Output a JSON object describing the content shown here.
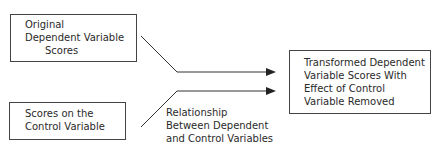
{
  "boxes": {
    "original": {
      "lines": [
        "Original",
        "Dependent Variable",
        "Scores"
      ]
    },
    "control": {
      "lines": [
        "Scores on the",
        "Control Variable"
      ]
    },
    "transformed": {
      "lines": [
        "Transformed Dependent",
        "Variable Scores With",
        "Effect of Control",
        "Variable Removed"
      ]
    }
  },
  "label": {
    "lines": [
      "Relationship",
      "Between Dependent",
      "and Control Variables"
    ]
  },
  "colors": {
    "line": "#333333",
    "text": "#2a2a2a"
  }
}
